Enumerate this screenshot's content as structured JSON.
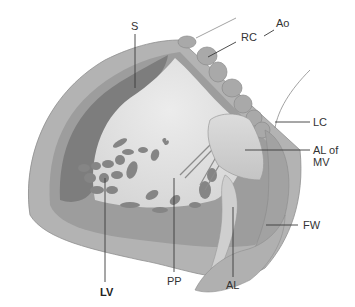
{
  "figure": {
    "colors": {
      "background": "#ffffff",
      "outer_wall": "#b3b3b3",
      "outer_wall_edge": "#8f8f8f",
      "mid_wall": "#9d9d9d",
      "septum_dark": "#7d7d7d",
      "cavity": "#e3e3e3",
      "trabeculae": "#858585",
      "valve_cusps": "#a9a9a9",
      "leaflet": "#d2d2d2",
      "label_text": "#333333",
      "leader_line": "#3a3a3a"
    }
  },
  "labels": {
    "S": "S",
    "Ao": "Ao",
    "RC": "RC",
    "LC": "LC",
    "AL_of_MV_line1": "AL of",
    "AL_of_MV_line2": "MV",
    "FW": "FW",
    "LV": "LV",
    "PP": "PP",
    "AL": "AL"
  }
}
